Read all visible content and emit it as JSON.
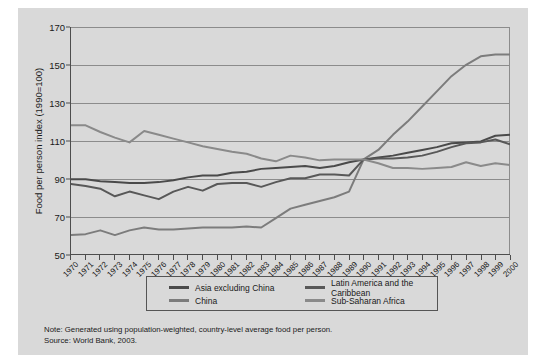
{
  "chart_data": {
    "type": "line",
    "title": "",
    "xlabel": "",
    "ylabel": "Food per person index (1990=100)",
    "ylim": [
      50,
      170
    ],
    "ytick_values": [
      50,
      70,
      90,
      110,
      130,
      150,
      170
    ],
    "grid": true,
    "legend_position": "bottom",
    "x": [
      1970,
      1971,
      1972,
      1973,
      1974,
      1975,
      1976,
      1977,
      1978,
      1979,
      1980,
      1981,
      1982,
      1983,
      1984,
      1985,
      1986,
      1987,
      1988,
      1989,
      1990,
      1991,
      1992,
      1993,
      1994,
      1995,
      1996,
      1997,
      1998,
      1999,
      2000
    ],
    "series": [
      {
        "name": "Asia excluding China",
        "color": "#4a4a4a",
        "values": [
          89.5,
          89.5,
          88.5,
          88.0,
          87.5,
          87.5,
          88.0,
          89.0,
          90.5,
          91.5,
          91.5,
          93.0,
          93.5,
          95.0,
          95.5,
          96.0,
          96.5,
          95.5,
          96.5,
          98.5,
          100.0,
          101.0,
          102.0,
          103.5,
          105.0,
          106.5,
          108.5,
          109.0,
          109.5,
          112.5,
          113.0
        ]
      },
      {
        "name": "China",
        "color": "#7c7c7c",
        "values": [
          60.0,
          60.5,
          62.5,
          60.0,
          62.5,
          64.0,
          63.0,
          63.0,
          63.5,
          64.0,
          64.0,
          64.0,
          64.5,
          64.0,
          69.0,
          74.0,
          76.0,
          78.0,
          80.0,
          83.0,
          100.0,
          105.0,
          113.0,
          120.0,
          128.0,
          136.0,
          144.0,
          150.0,
          154.5,
          155.5,
          155.5
        ]
      },
      {
        "name": "Latin America and the Caribbean",
        "color": "#585858",
        "values": [
          87.0,
          86.0,
          84.5,
          80.5,
          83.0,
          81.0,
          79.0,
          83.0,
          85.5,
          83.5,
          87.0,
          87.5,
          87.5,
          85.5,
          88.0,
          90.0,
          90.0,
          92.0,
          92.0,
          91.5,
          100.0,
          100.5,
          100.5,
          101.0,
          102.0,
          104.0,
          106.5,
          108.5,
          109.0,
          110.5,
          108.0
        ]
      },
      {
        "name": "Sub-Saharan Africa",
        "color": "#8a8a8a",
        "values": [
          118.0,
          118.0,
          114.5,
          111.5,
          109.0,
          115.0,
          113.0,
          111.0,
          109.0,
          107.0,
          105.5,
          104.0,
          103.0,
          100.5,
          99.0,
          102.0,
          101.0,
          99.5,
          100.0,
          100.0,
          100.0,
          98.0,
          95.5,
          95.5,
          95.0,
          95.5,
          96.0,
          98.5,
          96.5,
          98.0,
          97.0
        ]
      }
    ]
  },
  "legend": {
    "items": [
      {
        "label": "Asia excluding China"
      },
      {
        "label": "China"
      },
      {
        "label": "Latin America and the Caribbean"
      },
      {
        "label": "Sub-Saharan Africa"
      }
    ]
  },
  "notes": {
    "note_line": "Note: Generated using population-weighted, country-level average food per person.",
    "source_line": "Source: World Bank, 2003."
  }
}
